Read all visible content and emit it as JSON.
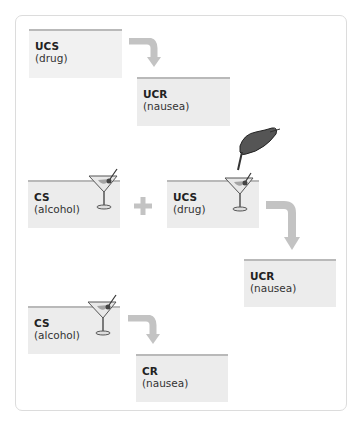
{
  "diagram": {
    "type": "classical-conditioning-flow",
    "colors": {
      "box_fill": "#ececec",
      "box_top_bar": "#b9b9b9",
      "arrow": "#c3c3c3",
      "plus": "#c3c3c3",
      "frame_border": "#dcdcdc"
    },
    "stage1": {
      "stimulus": {
        "label": "UCS",
        "sub": "(drug)"
      },
      "response": {
        "label": "UCR",
        "sub": "(nausea)"
      }
    },
    "stage2": {
      "stimulus_a": {
        "label": "CS",
        "sub": "(alcohol)",
        "icon": "martini-glass-icon"
      },
      "operator": "+",
      "stimulus_b": {
        "label": "UCS",
        "sub": "(drug)",
        "icon": "hand-dropping-drug-into-martini-icon"
      },
      "response": {
        "label": "UCR",
        "sub": "(nausea)"
      }
    },
    "stage3": {
      "stimulus": {
        "label": "CS",
        "sub": "(alcohol)",
        "icon": "martini-glass-icon"
      },
      "response": {
        "label": "CR",
        "sub": "(nausea)"
      }
    }
  }
}
